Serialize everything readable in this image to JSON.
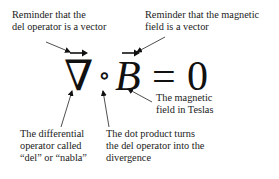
{
  "equation": {
    "nabla": "∇",
    "dot": "∘",
    "field": "B",
    "equals": "=",
    "zero": "0",
    "vector_arrow": "→"
  },
  "annotations": {
    "del_vector": [
      "Reminder that the",
      "del operator is a vector"
    ],
    "field_vector": [
      "Reminder that the magnetic",
      "field is a vector"
    ],
    "field_units": [
      "The magnetic",
      "field in Teslas"
    ],
    "del_operator": [
      "The differential",
      "operator called",
      "“del” or “nabla”"
    ],
    "dot_product": [
      "The dot product turns",
      "the del operator into the",
      "divergence"
    ]
  },
  "colors": {
    "text": "#1a1a1a",
    "background": "#ffffff"
  }
}
